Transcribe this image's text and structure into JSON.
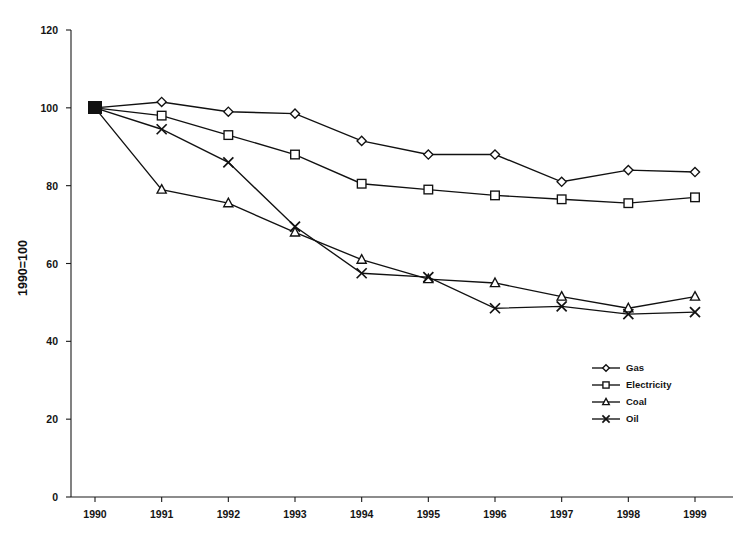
{
  "chart_data": {
    "type": "line",
    "title": "",
    "subtitle": "",
    "xlabel": "",
    "ylabel": "1990=100",
    "x": [
      "1990",
      "1991",
      "1992",
      "1993",
      "1994",
      "1995",
      "1996",
      "1997",
      "1998",
      "1999"
    ],
    "categories": [
      "1990",
      "1991",
      "1992",
      "1993",
      "1994",
      "1995",
      "1996",
      "1997",
      "1998",
      "1999"
    ],
    "xlim": [
      1990,
      1999
    ],
    "ylim": [
      0,
      120
    ],
    "yticks": [
      0,
      20,
      40,
      60,
      80,
      100,
      120
    ],
    "ytick_labels": [
      "0",
      "20",
      "40",
      "60",
      "80",
      "100",
      "120"
    ],
    "xtick_labels": [
      "1990",
      "1991",
      "1992",
      "1993",
      "1994",
      "1995",
      "1996",
      "1997",
      "1998",
      "1999"
    ],
    "grid": false,
    "legend_position": "bottom-right",
    "series": [
      {
        "name": "Gas",
        "marker": "diamond",
        "values": [
          100,
          101.5,
          99,
          98.5,
          91.5,
          88,
          88,
          81,
          84,
          83.5
        ]
      },
      {
        "name": "Electricity",
        "marker": "square",
        "values": [
          100,
          98,
          93,
          88,
          80.5,
          79,
          77.5,
          76.5,
          75.5,
          77
        ]
      },
      {
        "name": "Coal",
        "marker": "triangle",
        "values": [
          100,
          79,
          75.5,
          68,
          61,
          56,
          55,
          51.5,
          48.5,
          51.5
        ]
      },
      {
        "name": "Oil",
        "marker": "cross",
        "values": [
          100,
          94.5,
          86,
          69.5,
          57.5,
          56.5,
          48.5,
          49,
          47,
          47.5
        ]
      }
    ]
  },
  "legend": {
    "items": [
      {
        "label": "Gas"
      },
      {
        "label": "Electricity"
      },
      {
        "label": "Coal"
      },
      {
        "label": "Oil"
      }
    ]
  }
}
